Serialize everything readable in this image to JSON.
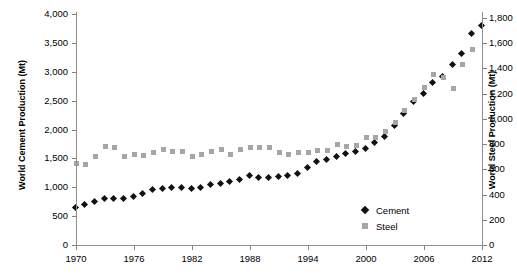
{
  "chart_data": {
    "type": "scatter",
    "title": "",
    "xlabel": "",
    "ylabel": "World Cement Production (Mt)",
    "y2label": "World Steel Production (Mt)",
    "xlim": [
      1970,
      2012
    ],
    "ylim": [
      0,
      4000
    ],
    "y2lim": [
      0,
      1800
    ],
    "grid": false,
    "legend_position": "bottom-right",
    "x_ticks": [
      "1970",
      "1976",
      "1982",
      "1988",
      "1994",
      "2000",
      "2006",
      "2012"
    ],
    "y_ticks": [
      "0",
      "500",
      "1,000",
      "1,500",
      "2,000",
      "2,500",
      "3,000",
      "3,500",
      "4,000"
    ],
    "y2_ticks": [
      "0",
      "200",
      "400",
      "600",
      "800",
      "1,000",
      "1,200",
      "1,400",
      "1,600",
      "1,800"
    ],
    "x": [
      1970,
      1971,
      1972,
      1973,
      1974,
      1975,
      1976,
      1977,
      1978,
      1979,
      1980,
      1981,
      1982,
      1983,
      1984,
      1985,
      1986,
      1987,
      1988,
      1989,
      1990,
      1991,
      1992,
      1993,
      1994,
      1995,
      1996,
      1997,
      1998,
      1999,
      2000,
      2001,
      2002,
      2003,
      2004,
      2005,
      2006,
      2007,
      2008,
      2009,
      2010,
      2011,
      2012
    ],
    "series": [
      {
        "name": "Cement",
        "axis": "left",
        "unit": "Mt",
        "marker": "diamond",
        "color": "#111111",
        "values": [
          640,
          680,
          730,
          780,
          790,
          780,
          830,
          880,
          940,
          960,
          970,
          980,
          960,
          980,
          1030,
          1050,
          1080,
          1120,
          1190,
          1150,
          1160,
          1170,
          1180,
          1220,
          1320,
          1420,
          1460,
          1520,
          1560,
          1610,
          1660,
          1750,
          1860,
          2050,
          2260,
          2460,
          2600,
          2800,
          2900,
          3100,
          3300,
          3650,
          3780
        ]
      },
      {
        "name": "Steel",
        "axis": "right",
        "unit": "Mt",
        "marker": "square",
        "color": "#a6a6a6",
        "values": [
          650,
          640,
          700,
          780,
          770,
          700,
          720,
          710,
          730,
          760,
          740,
          740,
          700,
          720,
          740,
          760,
          720,
          760,
          770,
          770,
          770,
          730,
          720,
          730,
          730,
          750,
          750,
          800,
          780,
          790,
          850,
          850,
          900,
          970,
          1070,
          1150,
          1250,
          1350,
          1330,
          1240,
          1430,
          1550,
          null
        ]
      }
    ]
  },
  "legend": {
    "items": [
      {
        "label": "Cement",
        "marker": "diamond",
        "color": "#111111"
      },
      {
        "label": "Steel",
        "marker": "square",
        "color": "#a6a6a6"
      }
    ]
  },
  "axes": {
    "left_title": "World Cement Production (Mt)",
    "right_title": "World Steel Production (Mt)"
  },
  "geometry": {
    "x0_px": 76,
    "x1_px": 482,
    "x0_val": 1970,
    "x1_val": 2012,
    "y0_px": 245,
    "y_top_px": 14,
    "y0_val": 0,
    "y_top_val": 4000,
    "y2_0_px": 245,
    "y2_top_px": 18,
    "y2_0_val": 0,
    "y2_top_val": 1800
  }
}
